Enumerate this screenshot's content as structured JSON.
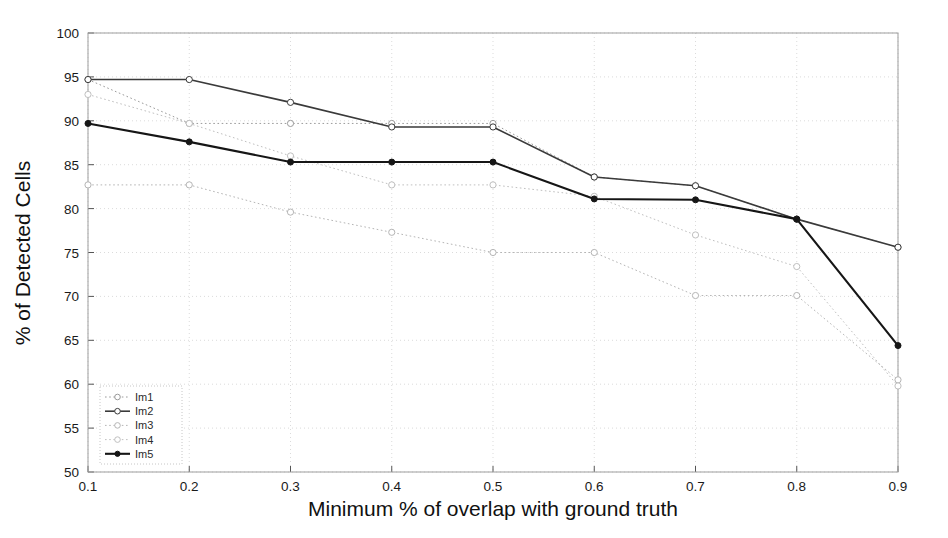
{
  "chart_data": {
    "type": "line",
    "title": "",
    "xlabel": "Minimum % of overlap with ground truth",
    "ylabel": "% of Detected Cells",
    "x": [
      0.1,
      0.2,
      0.3,
      0.4,
      0.5,
      0.6,
      0.7,
      0.8,
      0.9
    ],
    "xlim": [
      0.1,
      0.9
    ],
    "ylim": [
      50,
      100
    ],
    "xticks": [
      "0.1",
      "0.2",
      "0.3",
      "0.4",
      "0.5",
      "0.6",
      "0.7",
      "0.8",
      "0.9"
    ],
    "yticks": [
      "50",
      "55",
      "60",
      "65",
      "70",
      "75",
      "80",
      "85",
      "90",
      "95",
      "100"
    ],
    "grid": true,
    "legend_position": "lower left",
    "series": [
      {
        "name": "Im1",
        "color": "#9a9a9a",
        "style": "dotted",
        "marker": "circle-open",
        "width": 1,
        "values": [
          94.7,
          89.7,
          89.7,
          89.7,
          89.7,
          83.6,
          82.6,
          78.8,
          75.6
        ]
      },
      {
        "name": "Im2",
        "color": "#3a3a3a",
        "style": "solid",
        "marker": "circle-open",
        "width": 1.6,
        "values": [
          94.7,
          94.7,
          92.1,
          89.3,
          89.3,
          83.6,
          82.6,
          78.8,
          75.6
        ]
      },
      {
        "name": "Im3",
        "color": "#b5b5b5",
        "style": "dotted",
        "marker": "circle-open",
        "width": 1,
        "values": [
          82.7,
          82.7,
          79.6,
          77.3,
          75.0,
          75.0,
          70.1,
          70.1,
          60.5
        ]
      },
      {
        "name": "Im4",
        "color": "#c0c0c0",
        "style": "dotted",
        "marker": "circle-open",
        "width": 1,
        "values": [
          93.0,
          89.7,
          86.0,
          82.7,
          82.7,
          81.4,
          77.0,
          73.4,
          59.8
        ]
      },
      {
        "name": "Im5",
        "color": "#161616",
        "style": "solid",
        "marker": "circle-filled",
        "width": 2.1,
        "values": [
          89.7,
          87.6,
          85.3,
          85.3,
          85.3,
          81.1,
          81.0,
          78.8,
          64.4
        ]
      }
    ]
  },
  "legend": {
    "entries": [
      "Im1",
      "Im2",
      "Im3",
      "Im4",
      "Im5"
    ]
  },
  "axes": {
    "x_title": "Minimum % of overlap with ground truth",
    "y_title": "% of Detected Cells"
  }
}
